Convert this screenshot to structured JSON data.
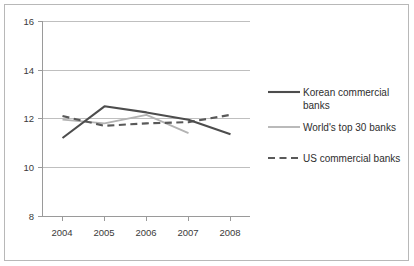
{
  "chart_data": {
    "type": "line",
    "title": "",
    "subtitle": "",
    "xlabel": "",
    "ylabel": "",
    "categories": [
      "2004",
      "2005",
      "2006",
      "2007",
      "2008"
    ],
    "x": [
      2004,
      2005,
      2006,
      2007,
      2008
    ],
    "xlim": [
      2004,
      2008
    ],
    "ylim": [
      8,
      16
    ],
    "yticks": [
      8,
      10,
      12,
      14,
      16
    ],
    "ytick_labels": [
      "8",
      "10",
      "12",
      "14",
      "16"
    ],
    "xtick_labels": [
      "2004",
      "2005",
      "2006",
      "2007",
      "2008"
    ],
    "grid": "horizontal",
    "legend_position": "right",
    "series": [
      {
        "name": "Korean commercial banks",
        "style": "solid",
        "color": "#4d4d4d",
        "values": [
          11.2,
          12.5,
          12.25,
          11.95,
          11.35
        ]
      },
      {
        "name": "World's top 30 banks",
        "style": "solid",
        "color": "#b3b3b3",
        "values": [
          11.95,
          11.8,
          12.15,
          11.4,
          null
        ]
      },
      {
        "name": "US commercial banks",
        "style": "dashed",
        "color": "#595959",
        "values": [
          12.1,
          11.7,
          11.8,
          11.85,
          12.15
        ]
      }
    ]
  },
  "legend": {
    "items": [
      {
        "label": "Korean commercial banks"
      },
      {
        "label": "World's top 30 banks"
      },
      {
        "label": "US commercial banks"
      }
    ]
  },
  "axes": {
    "y": {
      "labels": [
        "16",
        "14",
        "12",
        "10",
        "8"
      ]
    },
    "x": {
      "labels": [
        "2004",
        "2005",
        "2006",
        "2007",
        "2008"
      ]
    }
  }
}
